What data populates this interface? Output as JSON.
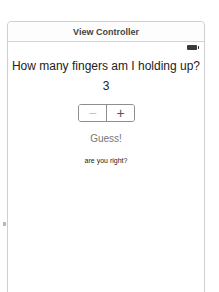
{
  "scene": {
    "title": "View Controller"
  },
  "status_bar": {
    "battery_icon": "battery-icon"
  },
  "main": {
    "question": "How many fingers am I holding up?",
    "count_value": "3",
    "stepper": {
      "minus_label": "−",
      "plus_label": "+"
    },
    "guess_button_label": "Guess!",
    "result_text": "are you right?"
  },
  "colors": {
    "frame_border": "#cfcfcf",
    "text": "#222222",
    "button_text": "#777777",
    "stepper_border": "#8e8e8e"
  }
}
